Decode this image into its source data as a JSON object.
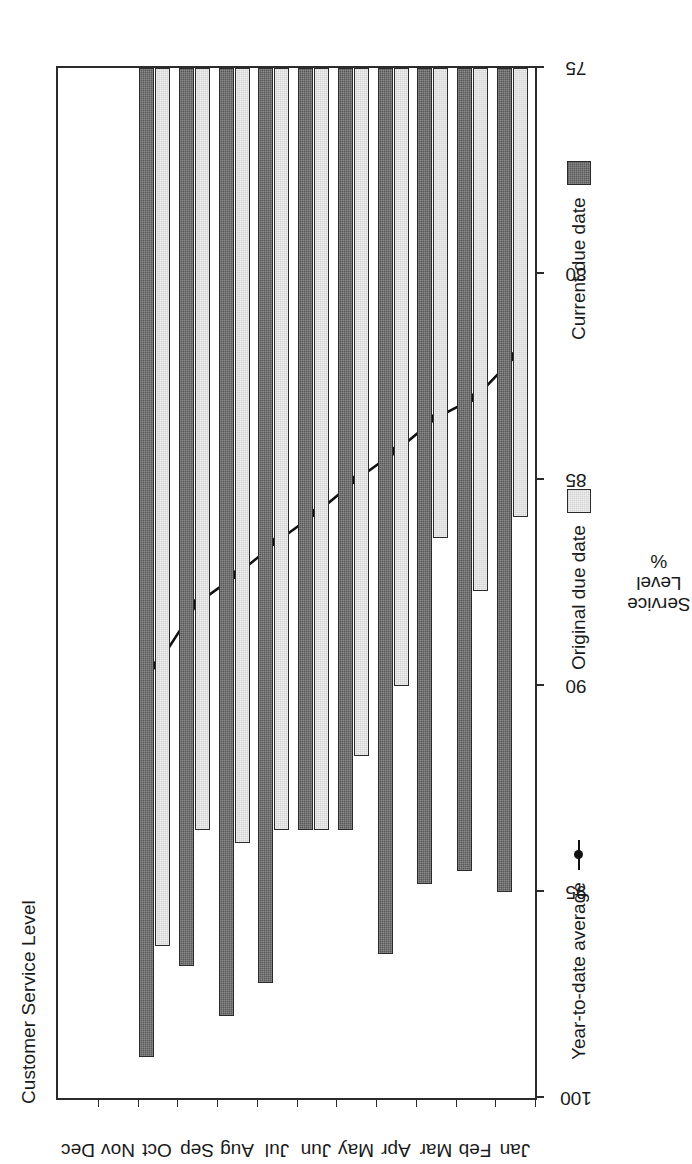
{
  "chart_data": {
    "type": "bar",
    "title": "Customer Service Level",
    "xlabel": "",
    "ylabel": "Service\nLevel\n%",
    "ylabel_lines": [
      "Service",
      "Level",
      "%"
    ],
    "orientation": "vertical-bars-rotated-page",
    "grid": false,
    "ylim": [
      75,
      100
    ],
    "yticks": [
      100,
      95,
      90,
      85,
      80,
      75
    ],
    "ytick_labels": [
      "100",
      "95",
      "90",
      "85",
      "80",
      "75"
    ],
    "categories": [
      "Jan",
      "Feb",
      "Mar",
      "Apr",
      "May",
      "Jun",
      "Jul",
      "Aug",
      "Sep",
      "Oct",
      "Nov",
      "Dec"
    ],
    "series": [
      {
        "name": "Current due date",
        "kind": "bar",
        "color": "#585858",
        "values": [
          95.0,
          94.5,
          94.8,
          96.5,
          93.5,
          93.5,
          97.2,
          98.0,
          96.8,
          99.0,
          null,
          null
        ]
      },
      {
        "name": "Original due date",
        "kind": "bar",
        "color": "#d4d4d4",
        "values": [
          85.9,
          87.7,
          86.4,
          90.0,
          91.7,
          93.5,
          93.5,
          93.8,
          93.5,
          96.3,
          null,
          null
        ]
      },
      {
        "name": "Year-to-date average",
        "kind": "line",
        "color": "#111111",
        "marker": "filled-circle",
        "values": [
          82.0,
          83.0,
          83.5,
          84.3,
          85.0,
          85.8,
          86.5,
          87.3,
          88.0,
          89.5,
          null,
          null
        ]
      }
    ],
    "legend": {
      "position": "below-plot",
      "entries": [
        {
          "label": "Year-to-date average",
          "marker": "line-with-dot"
        },
        {
          "label": "Original due date",
          "marker": "light-gray-square"
        },
        {
          "label": "Current due date",
          "marker": "dark-gray-square"
        }
      ]
    }
  }
}
